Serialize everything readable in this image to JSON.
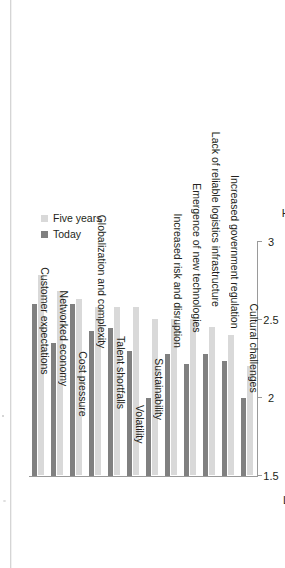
{
  "chart_data": {
    "type": "bar",
    "orientation": "vertical-rotated",
    "title": "",
    "xlabel": "",
    "ylabel": "",
    "ylim": [
      1.5,
      3
    ],
    "yticks": [
      "1.5",
      "2",
      "2.5",
      "3"
    ],
    "ytick_values": [
      1.5,
      2,
      2.5,
      3
    ],
    "axis_end_labels": {
      "low": "Low",
      "high": "High"
    },
    "grid": false,
    "legend_position": "top-right",
    "colors": {
      "today": "#808080",
      "five_years": "#d9d9d9",
      "axis": "#9a9a9a",
      "text": "#231f20"
    },
    "categories": [
      "Customer expectations",
      "Networked economy",
      "Cost pressure",
      "Globalization and complexity",
      "Talent shortfalls",
      "Volatility",
      "Sustainability",
      "Increased risk and disruption",
      "Emergence of new technologies",
      "Lack of reliable logistics infrastructure",
      "Increased government regulation",
      "Cultural challenges"
    ],
    "series": [
      {
        "name": "Today",
        "color": "#808080",
        "values": [
          2.6,
          2.35,
          2.6,
          2.43,
          2.45,
          2.3,
          2.0,
          2.28,
          2.22,
          2.28,
          2.24,
          2.0
        ]
      },
      {
        "name": "Five years",
        "color": "#d9d9d9",
        "values": [
          2.78,
          2.68,
          2.63,
          2.58,
          2.58,
          2.58,
          2.5,
          2.5,
          2.5,
          2.45,
          2.4,
          2.2
        ]
      }
    ]
  },
  "legend": {
    "items": [
      {
        "label": "Today",
        "key": "today"
      },
      {
        "label": "Five years",
        "key": "five"
      }
    ]
  }
}
